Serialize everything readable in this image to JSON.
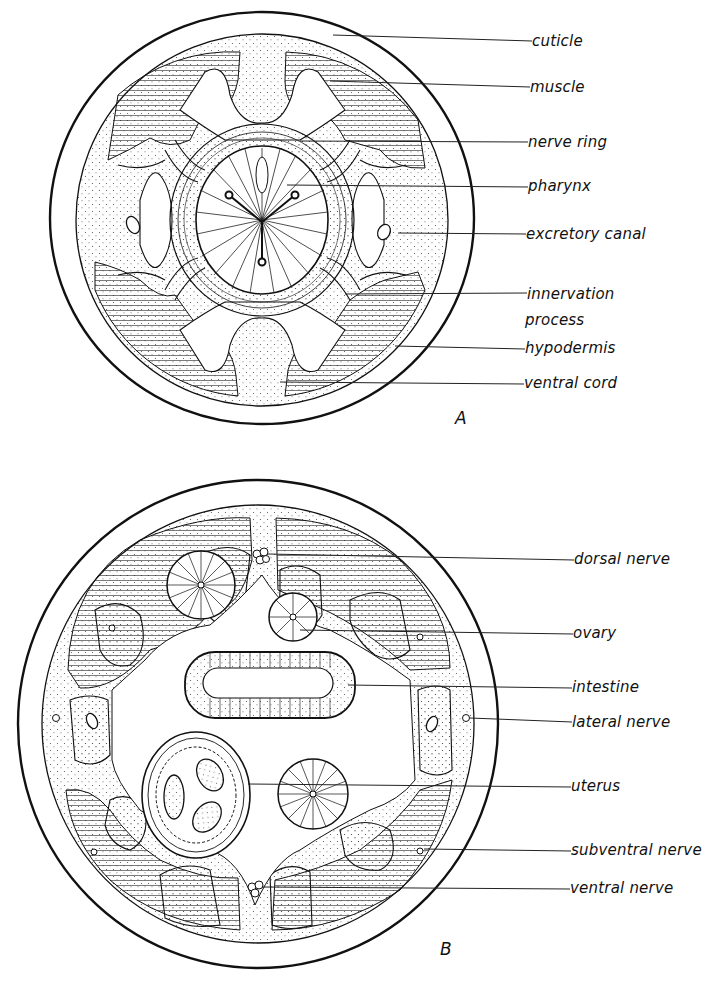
{
  "figure": {
    "panels": [
      {
        "id": "A",
        "letter": "A",
        "labels": [
          {
            "text": "cuticle",
            "x": 532,
            "y": 33
          },
          {
            "text": "muscle",
            "x": 530,
            "y": 81
          },
          {
            "text": "nerve ring",
            "x": 528,
            "y": 136
          },
          {
            "text": "pharynx",
            "x": 528,
            "y": 180
          },
          {
            "text": "excretory canal",
            "x": 526,
            "y": 228
          },
          {
            "text": "innervation",
            "x": 527,
            "y": 288
          },
          {
            "text": "process",
            "x": 525,
            "y": 314
          },
          {
            "text": "hypodermis",
            "x": 525,
            "y": 342
          },
          {
            "text": "ventral cord",
            "x": 524,
            "y": 377
          }
        ]
      },
      {
        "id": "B",
        "letter": "B",
        "labels": [
          {
            "text": "dorsal nerve",
            "x": 574,
            "y": 552
          },
          {
            "text": "ovary",
            "x": 573,
            "y": 628
          },
          {
            "text": "intestine",
            "x": 572,
            "y": 682
          },
          {
            "text": "lateral nerve",
            "x": 572,
            "y": 717
          },
          {
            "text": "uterus",
            "x": 571,
            "y": 781
          },
          {
            "text": "subventral nerve",
            "x": 571,
            "y": 845
          },
          {
            "text": "ventral nerve",
            "x": 570,
            "y": 883
          }
        ]
      }
    ],
    "colors": {
      "ink": "#111111",
      "paper": "#ffffff",
      "stipple": "#555555"
    }
  }
}
